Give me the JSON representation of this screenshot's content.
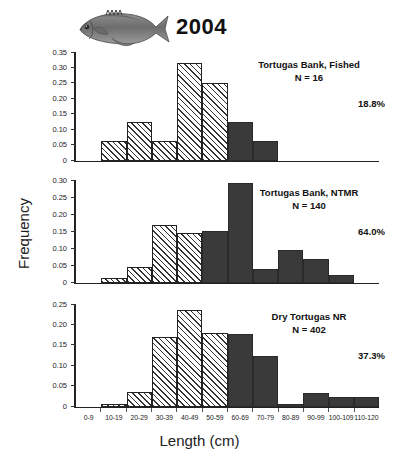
{
  "figure": {
    "title": "2004",
    "fish_icon": "grouper-fish-illustration",
    "ylabel": "Frequency",
    "xlabel": "Length (cm)"
  },
  "chart_data": {
    "type": "bar",
    "title": "2004",
    "xlabel": "Length (cm)",
    "ylabel": "Frequency",
    "grid": false,
    "legend_position": "none",
    "categories": [
      "0-9",
      "10-19",
      "20-29",
      "30-39",
      "40-49",
      "50-59",
      "60-69",
      "70-79",
      "80-89",
      "90-99",
      "100-109",
      "110-120"
    ],
    "panels": [
      {
        "site": "Tortugas Bank, Fished",
        "n_label": "N = 16",
        "n": 16,
        "percent_label": "18.8%",
        "ylim": [
          0,
          0.35
        ],
        "yticks": [
          "0",
          "0.05",
          "0.10",
          "0.15",
          "0.20",
          "0.25",
          "0.30",
          "0.35"
        ],
        "ytick_values": [
          0,
          0.05,
          0.1,
          0.15,
          0.2,
          0.25,
          0.3,
          0.35
        ],
        "values": [
          0,
          0.063,
          0.125,
          0.063,
          0.313,
          0.25,
          0.125,
          0.063,
          0,
          0,
          0,
          0
        ],
        "fills": [
          "none",
          "hatched",
          "hatched",
          "hatched",
          "hatched",
          "hatched",
          "solid",
          "solid",
          "none",
          "none",
          "none",
          "none"
        ]
      },
      {
        "site": "Tortugas Bank, NTMR",
        "n_label": "N = 140",
        "n": 140,
        "percent_label": "64.0%",
        "ylim": [
          0,
          0.3
        ],
        "yticks": [
          "0",
          "0.05",
          "0.10",
          "0.15",
          "0.20",
          "0.25",
          "0.30"
        ],
        "ytick_values": [
          0,
          0.05,
          0.1,
          0.15,
          0.2,
          0.25,
          0.3
        ],
        "values": [
          0,
          0.014,
          0.046,
          0.168,
          0.145,
          0.15,
          0.29,
          0.039,
          0.095,
          0.07,
          0.023,
          0
        ],
        "fills": [
          "none",
          "hatched",
          "hatched",
          "hatched",
          "hatched",
          "solid",
          "solid",
          "solid",
          "solid",
          "solid",
          "solid",
          "none"
        ]
      },
      {
        "site": "Dry Tortugas NR",
        "n_label": "N = 402",
        "n": 402,
        "percent_label": "37.3%",
        "ylim": [
          0,
          0.25
        ],
        "yticks": [
          "0",
          "0.05",
          "0.10",
          "0.15",
          "0.20",
          "0.25"
        ],
        "ytick_values": [
          0,
          0.05,
          0.1,
          0.15,
          0.2,
          0.25
        ],
        "values": [
          0,
          0.007,
          0.035,
          0.17,
          0.235,
          0.18,
          0.178,
          0.123,
          0.005,
          0.033,
          0.023,
          0.023
        ],
        "fills": [
          "none",
          "hatched",
          "hatched",
          "hatched",
          "hatched",
          "hatched",
          "solid",
          "solid",
          "solid",
          "solid",
          "solid",
          "solid"
        ]
      }
    ]
  }
}
